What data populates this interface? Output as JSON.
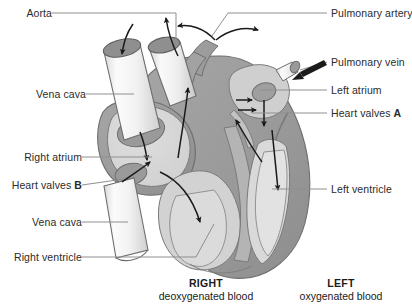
{
  "diagram": {
    "type": "anatomical-diagram",
    "background_color": "#ffffff",
    "colors": {
      "leader_line": "#8a8a8a",
      "arrow": "#1a1a1a",
      "outer_wall": "#9c9c9c",
      "chamber_fill": "#d6d6d6",
      "inner_fill": "#c4c4c4",
      "vessel_fill": "#f4f4f4",
      "vessel_opening": "#8f8f8f",
      "outline": "#6e6e6e",
      "text": "#2b2b2b"
    }
  },
  "labels": {
    "left": [
      {
        "id": "aorta",
        "text": "Aorta",
        "bold_suffix": ""
      },
      {
        "id": "vena-cava-upper",
        "text": "Vena cava",
        "bold_suffix": ""
      },
      {
        "id": "right-atrium",
        "text": "Right atrium",
        "bold_suffix": ""
      },
      {
        "id": "heart-valves-b",
        "text": "Heart valves ",
        "bold_suffix": "B"
      },
      {
        "id": "vena-cava-lower",
        "text": "Vena cava",
        "bold_suffix": ""
      },
      {
        "id": "right-ventricle",
        "text": "Right ventricle",
        "bold_suffix": ""
      }
    ],
    "right": [
      {
        "id": "pulmonary-artery",
        "text": "Pulmonary artery",
        "bold_suffix": ""
      },
      {
        "id": "pulmonary-vein",
        "text": "Pulmonary vein",
        "bold_suffix": ""
      },
      {
        "id": "left-atrium",
        "text": "Left atrium",
        "bold_suffix": ""
      },
      {
        "id": "heart-valves-a",
        "text": "Heart valves ",
        "bold_suffix": "A"
      },
      {
        "id": "left-ventricle",
        "text": "Left ventricle",
        "bold_suffix": ""
      }
    ]
  },
  "captions": {
    "right": {
      "side": "RIGHT",
      "subtitle": "deoxygenated blood"
    },
    "left": {
      "side": "LEFT",
      "subtitle": "oxygenated blood"
    }
  }
}
